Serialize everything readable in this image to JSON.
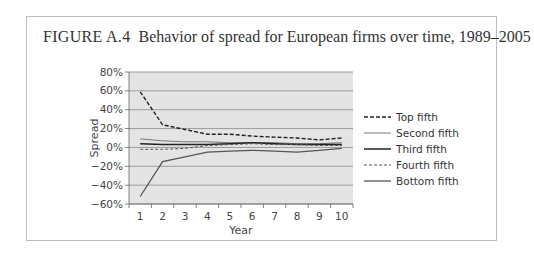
{
  "figure": {
    "label": "FIGURE A.4",
    "title": "Behavior of spread for European firms over time, 1989–2005"
  },
  "chart_data": {
    "type": "line",
    "title": "Behavior of spread for European firms over time, 1989–2005",
    "xlabel": "Year",
    "ylabel": "Spread",
    "x": [
      1,
      2,
      3,
      4,
      5,
      6,
      7,
      8,
      9,
      10
    ],
    "y_ticks": [
      "80%",
      "60%",
      "40%",
      "20%",
      "0%",
      "−20%",
      "−40%",
      "−60%"
    ],
    "ylim": [
      -60,
      80
    ],
    "grid": true,
    "legend_position": "right",
    "series": [
      {
        "name": "Top fifth",
        "style": "dashed",
        "color": "#222222",
        "values": [
          59,
          24,
          19,
          14,
          14,
          12,
          11,
          10,
          8,
          10
        ]
      },
      {
        "name": "Second fifth",
        "style": "solid-thin",
        "color": "#777777",
        "values": [
          9,
          7,
          6,
          6,
          5,
          5,
          5,
          4,
          4,
          5
        ]
      },
      {
        "name": "Third fifth",
        "style": "solid-thick",
        "color": "#222222",
        "values": [
          4,
          3,
          3,
          3,
          4,
          5,
          4,
          3,
          3,
          3
        ]
      },
      {
        "name": "Fourth fifth",
        "style": "dashed-thin",
        "color": "#555555",
        "values": [
          -2,
          -2,
          -1,
          2,
          3,
          4,
          3,
          3,
          2,
          2
        ]
      },
      {
        "name": "Bottom fifth",
        "style": "solid",
        "color": "#555555",
        "values": [
          -52,
          -15,
          -10,
          -5,
          -4,
          -3,
          -4,
          -5,
          -3,
          -1
        ]
      }
    ]
  }
}
